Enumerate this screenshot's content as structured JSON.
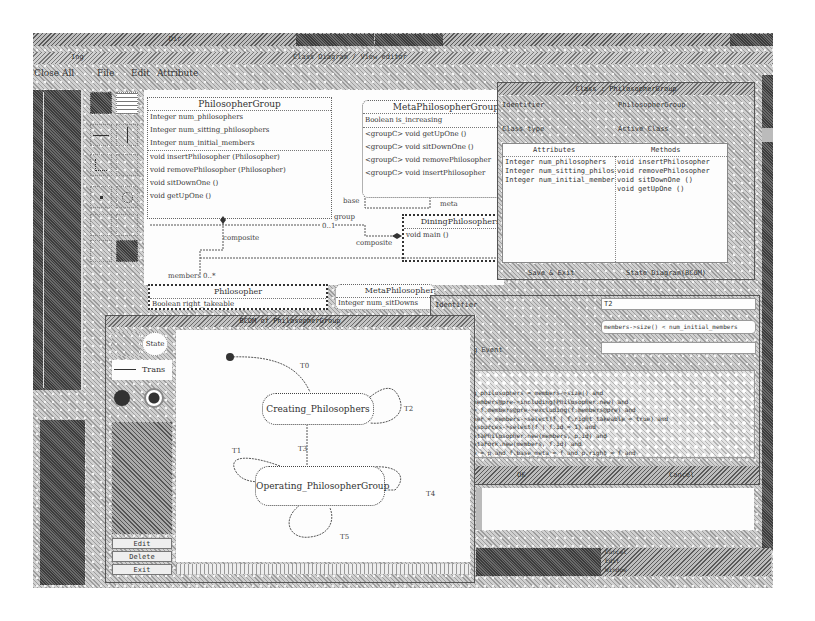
{
  "top_bar": {
    "left_tab": "Ing",
    "right_tab": "Dir"
  },
  "main_window": {
    "title": "Class Diagram / View editor",
    "menu": [
      {
        "label": "Close All"
      },
      {
        "label": "File"
      },
      {
        "label": "Edit"
      },
      {
        "label": "Attribute"
      }
    ]
  },
  "tool_palette": {
    "tools": [
      "select-tool",
      "class-tool",
      "association-tool",
      "generalization-tool",
      "dependency-tool",
      "note-tool",
      "point-tool",
      "state-tool",
      "aggregation-tool",
      "composition-tool",
      "flow-tool",
      "fill-tool"
    ]
  },
  "class_diagram": {
    "classes": [
      {
        "name": "PhilosopherGroup",
        "rows": [
          "Integer num_philosophers",
          "Integer num_sitting_philosophers",
          "Integer num_initial_members",
          "void insertPhilosopher (Philosopher)",
          "void removePhilosopher (Philosopher)",
          "void sitDownOne ()",
          "void getUpOne ()"
        ]
      },
      {
        "name": "MetaPhilosopherGroup",
        "rows": [
          "Boolean is_increasing",
          "<groupC> void getUpOne ()",
          "<groupC> void sitDownOne ()",
          "<groupC> void removePhilosopher",
          "<groupC> void insertPhilosopher"
        ]
      },
      {
        "name": "DiningPhilosophers",
        "rows": [
          "void main ()"
        ]
      },
      {
        "name": "Philosopher",
        "rows": [
          "Boolean right_takeable"
        ]
      },
      {
        "name": "MetaPhilosopher",
        "rows": [
          "Integer num_sitDowns"
        ]
      }
    ],
    "labels": {
      "composite_1": "composite",
      "composite_2": "composite",
      "members": "members",
      "members_mult": "0..*",
      "base": "base",
      "meta": "meta",
      "group": "group",
      "group_mult": "0..1"
    }
  },
  "class_dialog": {
    "title": "Class : PhilosopherGroup",
    "identifier_label": "Identifier",
    "identifier_value": "PhilosopherGroup",
    "class_type_label": "Class type",
    "class_type_value": "Active Class",
    "attributes_header": "Attributes",
    "methods_header": "Methods",
    "attributes": [
      "Integer num_philosophers",
      "Integer num_sitting_philosophers",
      "Integer num_initial_members"
    ],
    "methods": [
      "void insertPhilosopher",
      "void removePhilosopher",
      "void sitDownOne ()",
      "void getUpOne ()"
    ],
    "buttons": {
      "save": "Save & Exit",
      "state": "State Diagram(BCOM)"
    }
  },
  "state_window": {
    "title": "BCOM of PhilosopherGroup",
    "palette": {
      "state": "State",
      "trans": "Trans",
      "buttons": [
        "Edit",
        "Delete",
        "Exit"
      ]
    },
    "states": [
      {
        "name": "Creating_Philosophers"
      },
      {
        "name": "Operating_PhilosopherGroup"
      }
    ],
    "transitions": [
      "T0",
      "T2",
      "T3",
      "T1",
      "T4",
      "T5"
    ]
  },
  "transition_dialog": {
    "identifier_label": "Identifier",
    "identifier_value": "T2",
    "condition_label": "Condition",
    "condition_value": "members->size() < num_initial_members",
    "trigger_label": "Triggering Event",
    "trigger_value": "",
    "actions_label": "Actions",
    "actions_lines": [
      "(action",
      "post:",
      "num_sitting_philosophers = members->size() and",
      "members = members@pre->including(Philosopher.new) and",
      "f.members = f.members@pre->excluding(f.members@pre) and",
      "p.Philosopher = members->select(f | f.right_takeable = true) and",
      "f.Fork = resources->select(f | f.id = 1) and",
      "p.meta = MetaPhilosopher.new(members, p.id) and",
      "f.meta = MetaFork.new(members, f.id) and",
      "p.meta.base = p and f.base_meta = f and p.right = f and"
    ],
    "buttons": {
      "ok": "OK",
      "cancel": "Cancel"
    }
  },
  "taskbar": {
    "items": [
      "Cancel",
      "Edit",
      "Window"
    ]
  }
}
